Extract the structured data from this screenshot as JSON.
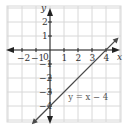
{
  "chart_data": {
    "type": "line",
    "title": "",
    "xlabel": "x",
    "ylabel": "y",
    "xlim": [
      -3,
      5
    ],
    "ylim": [
      -5,
      3
    ],
    "grid": true,
    "x_ticks": [
      "-2",
      "-1",
      "1",
      "2",
      "3",
      "4"
    ],
    "y_ticks": [
      "2",
      "1",
      "-1",
      "-2",
      "-3",
      "-4"
    ],
    "origin_label": "0",
    "series": [
      {
        "name": "y = x - 4",
        "equation": "y = x − 4",
        "slope": 1,
        "intercept": -4,
        "x": [
          -1.3,
          0,
          4,
          4.9
        ],
        "y": [
          -5.3,
          -4,
          0,
          0.9
        ]
      }
    ],
    "annotations": [
      {
        "text": "y = x − 4",
        "x": 1.3,
        "y": -3.6
      }
    ],
    "colors": {
      "line": "#4a4a4a",
      "axis": "#222222",
      "grid": "#d8d8d8"
    }
  }
}
